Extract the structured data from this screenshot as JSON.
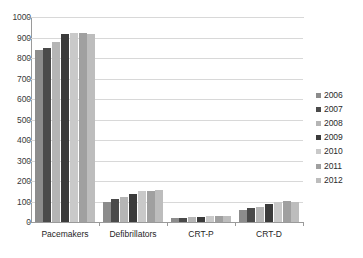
{
  "chart_data": {
    "type": "bar",
    "title": "",
    "subtitle": "",
    "xlabel": "",
    "ylabel": "",
    "ylim": [
      0,
      1000
    ],
    "ytick_step": 100,
    "yticks": [
      0,
      100,
      200,
      300,
      400,
      500,
      600,
      700,
      800,
      900,
      1000
    ],
    "ytick_labels": [
      "0",
      "100",
      "200",
      "300",
      "400",
      "500",
      "600",
      "700",
      "800",
      "900",
      "1000"
    ],
    "grid": true,
    "grid_axis": "y",
    "legend_position": "right",
    "categories": [
      "Pacemakers",
      "Defibrillators",
      "CRT-P",
      "CRT-D"
    ],
    "series": [
      {
        "name": "2006",
        "color": "#8c8c8c",
        "values": [
          840,
          100,
          20,
          60
        ]
      },
      {
        "name": "2007",
        "color": "#4a4a4a",
        "values": [
          850,
          110,
          22,
          68
        ]
      },
      {
        "name": "2008",
        "color": "#b5b5b5",
        "values": [
          880,
          122,
          23,
          75
        ]
      },
      {
        "name": "2009",
        "color": "#3b3b3b",
        "values": [
          915,
          135,
          25,
          88
        ]
      },
      {
        "name": "2010",
        "color": "#c9c9c9",
        "values": [
          920,
          150,
          28,
          100
        ]
      },
      {
        "name": "2011",
        "color": "#a0a0a0",
        "values": [
          920,
          152,
          28,
          103
        ]
      },
      {
        "name": "2012",
        "color": "#bdbdbd",
        "values": [
          918,
          158,
          28,
          100
        ]
      }
    ]
  },
  "legend": {
    "items": [
      {
        "label": "2006",
        "color": "#8c8c8c"
      },
      {
        "label": "2007",
        "color": "#4a4a4a"
      },
      {
        "label": "2008",
        "color": "#b5b5b5"
      },
      {
        "label": "2009",
        "color": "#3b3b3b"
      },
      {
        "label": "2010",
        "color": "#c9c9c9"
      },
      {
        "label": "2011",
        "color": "#a0a0a0"
      },
      {
        "label": "2012",
        "color": "#bdbdbd"
      }
    ]
  },
  "colors": {
    "axis": "#9a9a9a",
    "grid": "#d8d8d8",
    "text": "#2b2b2b",
    "background": "#ffffff"
  }
}
